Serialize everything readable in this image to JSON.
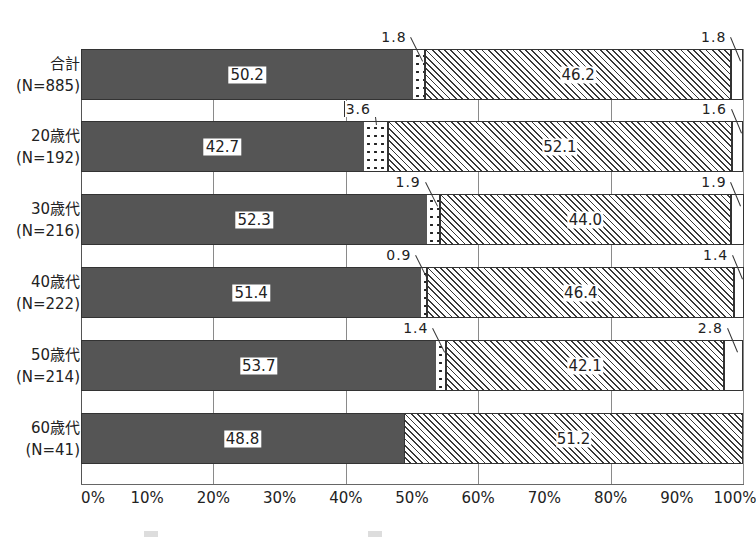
{
  "chart_data": {
    "type": "bar",
    "orientation": "horizontal",
    "stacked": true,
    "normalized": true,
    "title": "",
    "xlabel": "",
    "ylabel": "",
    "xlim": [
      0,
      100
    ],
    "grid": true,
    "gridlines_at": [
      20,
      40,
      60,
      80,
      100
    ],
    "x_tick_labels": [
      "0%",
      "10%",
      "20%",
      "30%",
      "40%",
      "50%",
      "60%",
      "70%",
      "80%",
      "90%",
      "100%"
    ],
    "categories": [
      {
        "name": "合計",
        "n": "(N=885)"
      },
      {
        "name": "20歳代",
        "n": "(N=192)"
      },
      {
        "name": "30歳代",
        "n": "(N=216)"
      },
      {
        "name": "40歳代",
        "n": "(N=222)"
      },
      {
        "name": "50歳代",
        "n": "(N=214)"
      },
      {
        "name": "60歳代",
        "n": "(N=41)"
      }
    ],
    "series": [
      {
        "name": "series-1 (dark)",
        "pattern": "solid-dark",
        "values": [
          50.2,
          42.7,
          52.3,
          51.4,
          53.7,
          48.8
        ]
      },
      {
        "name": "series-2 (dotted)",
        "pattern": "dots",
        "values": [
          1.8,
          3.6,
          1.9,
          0.9,
          1.4,
          0.0
        ]
      },
      {
        "name": "series-3 (hatched)",
        "pattern": "diagonal-hatch",
        "values": [
          46.2,
          52.1,
          44.0,
          46.4,
          42.1,
          51.2
        ]
      },
      {
        "name": "series-4 (white)",
        "pattern": "white",
        "values": [
          1.8,
          1.6,
          1.9,
          1.4,
          2.8,
          0.0
        ]
      }
    ],
    "value_labels": [
      [
        "50.2",
        "1.8",
        "46.2",
        "1.8"
      ],
      [
        "42.7",
        "3.6",
        "52.1",
        "1.6"
      ],
      [
        "52.3",
        "1.9",
        "44.0",
        "1.9"
      ],
      [
        "51.4",
        "0.9",
        "46.4",
        "1.4"
      ],
      [
        "53.7",
        "1.4",
        "42.1",
        "2.8"
      ],
      [
        "48.8",
        "",
        "51.2",
        ""
      ]
    ],
    "legend": "cut off at bottom of image (not legible)"
  }
}
